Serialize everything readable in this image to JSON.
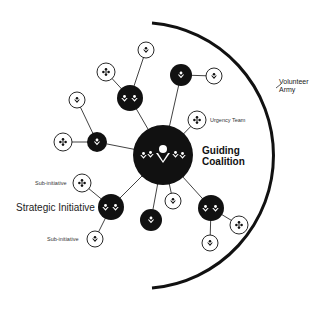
{
  "diagram": {
    "colors": {
      "dark_node": "#111111",
      "light_node_fill": "#ffffff",
      "stroke": "#111111",
      "background": "#ffffff"
    },
    "labels": {
      "center": [
        "Guiding",
        "Coalition"
      ],
      "urgency_team": "Urgency Team",
      "volunteer_army": [
        "Volunteer",
        "Army"
      ],
      "strategic_initiative": "Strategic Initiative",
      "sub_initiative_top": "Sub-initiative",
      "sub_initiative_bottom": "Sub-initiative"
    },
    "center_node": {
      "x": 163,
      "y": 155,
      "r": 30,
      "icon": "group-of-people-icon"
    },
    "outer_arc": {
      "cx": 152,
      "cy": 155,
      "r": 133,
      "label": "Volunteer Army"
    },
    "nodes": [
      {
        "id": "init-top",
        "type": "dark",
        "x": 130,
        "y": 98,
        "r": 13,
        "icon": "two-people-icon"
      },
      {
        "id": "leaf-top",
        "type": "light",
        "x": 146,
        "y": 50,
        "r": 8,
        "icon": "person-icon",
        "parent": "init-top"
      },
      {
        "id": "leaf-top-diamond",
        "type": "light",
        "x": 106,
        "y": 72,
        "r": 9,
        "icon": "diamond-team-icon",
        "parent": "init-top"
      },
      {
        "id": "init-upper-right",
        "type": "dark",
        "x": 181,
        "y": 75,
        "r": 11,
        "icon": "person-icon"
      },
      {
        "id": "leaf-upper-right",
        "type": "light",
        "x": 214,
        "y": 76,
        "r": 8,
        "icon": "person-icon",
        "parent": "init-upper-right"
      },
      {
        "id": "urgency-team",
        "type": "light",
        "x": 197,
        "y": 120,
        "r": 9,
        "icon": "diamond-team-icon",
        "label": "Urgency Team"
      },
      {
        "id": "init-left",
        "type": "dark",
        "x": 97,
        "y": 142,
        "r": 10,
        "icon": "person-icon"
      },
      {
        "id": "leaf-left-top",
        "type": "light",
        "x": 77,
        "y": 100,
        "r": 8,
        "icon": "person-icon",
        "parent": "init-left"
      },
      {
        "id": "leaf-left-diamond",
        "type": "light",
        "x": 63,
        "y": 142,
        "r": 9,
        "icon": "diamond-team-icon",
        "parent": "init-left"
      },
      {
        "id": "strategic-initiative",
        "type": "dark",
        "x": 111,
        "y": 207,
        "r": 13,
        "icon": "two-people-icon",
        "label": "Strategic Initiative"
      },
      {
        "id": "sub-initiative-top",
        "type": "light",
        "x": 82,
        "y": 183,
        "r": 9,
        "icon": "diamond-team-icon",
        "label": "Sub-initiative",
        "parent": "strategic-initiative"
      },
      {
        "id": "sub-initiative-bottom",
        "type": "light",
        "x": 95,
        "y": 239,
        "r": 8,
        "icon": "person-icon",
        "label": "Sub-initiative",
        "parent": "strategic-initiative"
      },
      {
        "id": "init-bottom",
        "type": "dark",
        "x": 151,
        "y": 220,
        "r": 11,
        "icon": "person-icon"
      },
      {
        "id": "leaf-bottom-center",
        "type": "light",
        "x": 173,
        "y": 201,
        "r": 8,
        "icon": "person-icon"
      },
      {
        "id": "init-lower-right",
        "type": "dark",
        "x": 211,
        "y": 208,
        "r": 13,
        "icon": "two-people-icon"
      },
      {
        "id": "leaf-lower-right-diamond",
        "type": "light",
        "x": 239,
        "y": 225,
        "r": 9,
        "icon": "diamond-team-icon",
        "parent": "init-lower-right"
      },
      {
        "id": "leaf-lower-right",
        "type": "light",
        "x": 210,
        "y": 243,
        "r": 8,
        "icon": "person-icon",
        "parent": "init-lower-right"
      }
    ]
  }
}
